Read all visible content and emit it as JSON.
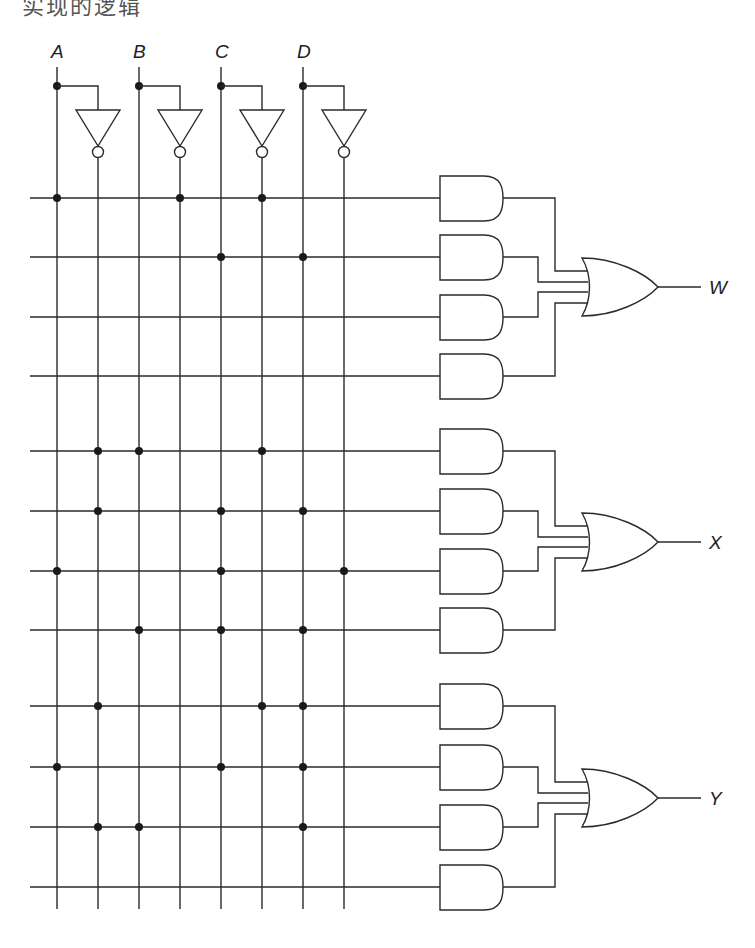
{
  "header": {
    "text": "实现的逻辑",
    "clipped": true
  },
  "diagram": {
    "type": "PLA logic circuit (AND-OR array)",
    "stroke_color": "#2a2a2a",
    "inputs": [
      {
        "name": "A",
        "x": 57,
        "inv_x": 98
      },
      {
        "name": "B",
        "x": 139,
        "inv_x": 180
      },
      {
        "name": "C",
        "x": 221,
        "inv_x": 262
      },
      {
        "name": "D",
        "x": 303,
        "inv_x": 344
      }
    ],
    "column_order": [
      "A",
      "A'",
      "B",
      "B'",
      "C",
      "C'",
      "D",
      "D'"
    ],
    "rows_y": [
      198,
      257,
      317,
      376,
      451,
      511,
      571,
      630,
      706,
      767,
      827,
      887
    ],
    "connections": [
      {
        "row": 1,
        "columns": [
          "A",
          "B'",
          "C'"
        ]
      },
      {
        "row": 2,
        "columns": [
          "C",
          "D"
        ]
      },
      {
        "row": 3,
        "columns": []
      },
      {
        "row": 4,
        "columns": []
      },
      {
        "row": 5,
        "columns": [
          "A'",
          "B",
          "C'"
        ]
      },
      {
        "row": 6,
        "columns": [
          "A'",
          "C",
          "D"
        ]
      },
      {
        "row": 7,
        "columns": [
          "A",
          "C",
          "D'"
        ]
      },
      {
        "row": 8,
        "columns": [
          "B",
          "C",
          "D"
        ]
      },
      {
        "row": 9,
        "columns": [
          "A'",
          "C'",
          "D"
        ]
      },
      {
        "row": 10,
        "columns": [
          "A",
          "C",
          "D"
        ]
      },
      {
        "row": 11,
        "columns": [
          "A'",
          "B",
          "D"
        ]
      },
      {
        "row": 12,
        "columns": []
      }
    ],
    "outputs": [
      {
        "name": "W",
        "rows": [
          1,
          2,
          3,
          4
        ],
        "or_y": 287
      },
      {
        "name": "X",
        "rows": [
          5,
          6,
          7,
          8
        ],
        "or_y": 542
      },
      {
        "name": "Y",
        "rows": [
          9,
          10,
          11,
          12
        ],
        "or_y": 798
      }
    ]
  }
}
